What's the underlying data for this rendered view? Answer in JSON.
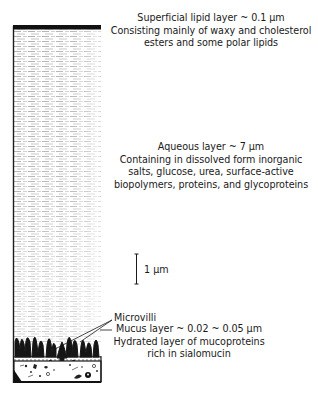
{
  "figure": {
    "colors": {
      "ink": "#1a1a1a",
      "background": "#ffffff",
      "aqueous_texture": "#8a8a8a"
    }
  },
  "layers": {
    "lipid": {
      "title": "Superficial lipid layer ~ 0.1 μm",
      "description_lines": [
        "Consisting mainly of waxy and cholesterol",
        "esters and some polar lipids"
      ]
    },
    "aqueous": {
      "title": "Aqueous layer ~ 7 μm",
      "description_lines": [
        "Containing in dissolved form inorganic",
        "salts, glucose, urea, surface-active",
        "biopolymers, proteins, and glycoproteins"
      ]
    },
    "mucus": {
      "title": "Mucus layer ~ 0.02 ~ 0.05 μm",
      "description_lines": [
        "Hydrated layer of mucoproteins",
        "rich in sialomucin"
      ]
    }
  },
  "annotations": {
    "microvilli": "Microvilli",
    "scale_bar": "1 μm"
  }
}
